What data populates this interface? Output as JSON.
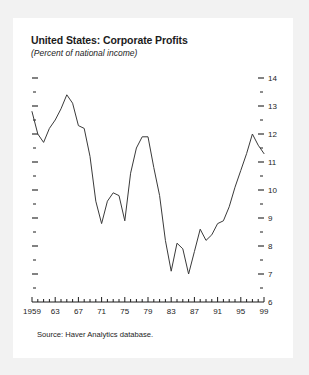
{
  "figure": {
    "title": "United States: Corporate Profits",
    "subtitle": "(Percent of national income)",
    "source": "Source: Haver Analytics database.",
    "line_color": "#3a3a3a",
    "axis_color": "#1c1c1c",
    "card_color": "#ffffff",
    "page_color": "#f2f2f2"
  },
  "chart_data": {
    "type": "line",
    "title": "United States: Corporate Profits",
    "subtitle": "(Percent of national income)",
    "xlabel": "",
    "ylabel": "Percent of national income",
    "xlim": [
      1959,
      1999
    ],
    "ylim": [
      6,
      14
    ],
    "grid": false,
    "legend": false,
    "y_axis_side": "right",
    "y_ticks_major": [
      6,
      7,
      8,
      9,
      10,
      11,
      12,
      13,
      14
    ],
    "y_tick_labels": [
      "6",
      "7",
      "8",
      "9",
      "10",
      "11",
      "12",
      "13",
      "14"
    ],
    "y_ticks_minor": [
      6.5,
      7.5,
      8.5,
      9.5,
      10.5,
      11.5,
      12.5,
      13.5
    ],
    "x_ticks_major": [
      1959,
      1963,
      1967,
      1971,
      1975,
      1979,
      1983,
      1987,
      1991,
      1995,
      1999
    ],
    "x_tick_labels": [
      "1959",
      "63",
      "67",
      "71",
      "75",
      "79",
      "83",
      "87",
      "91",
      "95",
      "99"
    ],
    "x_ticks_minor_step": 1,
    "series": [
      {
        "name": "Corporate profits",
        "x": [
          1959,
          1960,
          1961,
          1962,
          1963,
          1964,
          1965,
          1966,
          1967,
          1968,
          1969,
          1970,
          1971,
          1972,
          1973,
          1974,
          1975,
          1976,
          1977,
          1978,
          1979,
          1980,
          1981,
          1982,
          1983,
          1984,
          1985,
          1986,
          1987,
          1988,
          1989,
          1990,
          1991,
          1992,
          1993,
          1994,
          1995,
          1996,
          1997,
          1998,
          1999
        ],
        "values": [
          12.8,
          12.0,
          11.7,
          12.2,
          12.5,
          12.9,
          13.4,
          13.1,
          12.3,
          12.2,
          11.2,
          9.6,
          8.8,
          9.6,
          9.9,
          9.8,
          8.9,
          10.6,
          11.5,
          11.9,
          11.9,
          10.8,
          9.8,
          8.2,
          7.1,
          8.1,
          7.9,
          7.0,
          7.8,
          8.6,
          8.2,
          8.4,
          8.8,
          8.9,
          9.4,
          10.1,
          10.7,
          11.3,
          12.0,
          11.6,
          11.3
        ]
      }
    ]
  }
}
